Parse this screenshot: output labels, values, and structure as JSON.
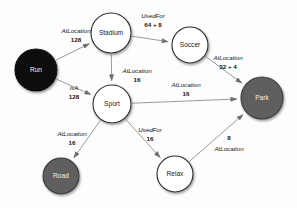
{
  "diagram": {
    "type": "knowledge-graph",
    "background_color": "#fdfdfd",
    "node_styles": {
      "light": {
        "fill": "#ffffff",
        "stroke": "#2b2b2b",
        "label_color": "#1a1a1a"
      },
      "gray": {
        "fill": "#5e5e5e",
        "stroke": "#3a3a3a",
        "label_color": "#f2f2f2"
      },
      "dark": {
        "fill": "#0d0d0d",
        "stroke": "#000000",
        "label_color": "#f2f2f2"
      }
    },
    "nodes": [
      {
        "id": "run",
        "label": "Run",
        "style": "dark",
        "cx": 36,
        "cy": 70,
        "r": 21
      },
      {
        "id": "stadium",
        "label": "Stadium",
        "style": "light",
        "cx": 111,
        "cy": 33,
        "r": 20
      },
      {
        "id": "soccer",
        "label": "Soccer",
        "style": "light",
        "cx": 190,
        "cy": 45,
        "r": 18
      },
      {
        "id": "sport",
        "label": "Sport",
        "style": "light",
        "cx": 112,
        "cy": 104,
        "r": 19
      },
      {
        "id": "park",
        "label": "Park",
        "style": "gray",
        "cx": 262,
        "cy": 98,
        "r": 21
      },
      {
        "id": "road",
        "label": "Road",
        "style": "gray",
        "cx": 61,
        "cy": 176,
        "r": 18
      },
      {
        "id": "relax",
        "label": "Relax",
        "style": "light",
        "cx": 175,
        "cy": 174,
        "r": 18
      }
    ],
    "edges": [
      {
        "id": "run-stadium",
        "source": "run",
        "target": "stadium",
        "relation": "AtLocation",
        "weight": "128",
        "rel_x": 76,
        "rel_y": 31,
        "w_x": 76,
        "w_y": 40
      },
      {
        "id": "stadium-soccer",
        "source": "stadium",
        "target": "soccer",
        "relation": "UsedFor",
        "weight": "64 + 8",
        "rel_x": 153,
        "rel_y": 16,
        "w_x": 153,
        "w_y": 25
      },
      {
        "id": "soccer-park",
        "source": "soccer",
        "target": "park",
        "relation": "AtLocation",
        "weight": "32 + 4",
        "rel_x": 228,
        "rel_y": 58,
        "w_x": 228,
        "w_y": 67
      },
      {
        "id": "stadium-sport",
        "source": "stadium",
        "target": "sport",
        "relation": "AtLocation",
        "weight": "16",
        "rel_x": 137,
        "rel_y": 71,
        "w_x": 137,
        "w_y": 80
      },
      {
        "id": "run-sport",
        "source": "run",
        "target": "sport",
        "relation": "isA",
        "weight": "128",
        "rel_x": 74,
        "rel_y": 88,
        "w_x": 74,
        "w_y": 97
      },
      {
        "id": "sport-park",
        "source": "sport",
        "target": "park",
        "relation": "AtLocation",
        "weight": "16",
        "rel_x": 186,
        "rel_y": 85,
        "w_x": 186,
        "w_y": 94
      },
      {
        "id": "sport-road",
        "source": "sport",
        "target": "road",
        "relation": "AtLocation",
        "weight": "16",
        "rel_x": 72,
        "rel_y": 134,
        "w_x": 72,
        "w_y": 143
      },
      {
        "id": "sport-relax",
        "source": "sport",
        "target": "relax",
        "relation": "UsedFor",
        "weight": "16",
        "rel_x": 150,
        "rel_y": 130,
        "w_x": 150,
        "w_y": 139
      },
      {
        "id": "relax-park",
        "source": "relax",
        "target": "park",
        "relation": "AtLocation",
        "weight": "8",
        "rel_x": 229,
        "rel_y": 149,
        "w_x": 229,
        "w_y": 138
      }
    ]
  }
}
